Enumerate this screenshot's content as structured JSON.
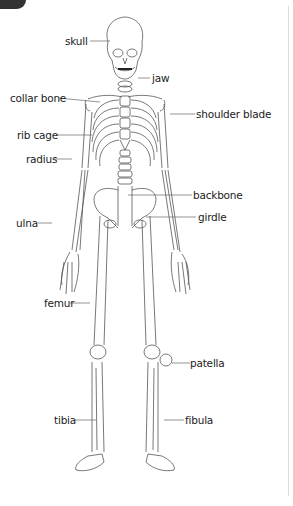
{
  "labels": {
    "skull": "skull",
    "jaw": "jaw",
    "collar_bone": "collar bone",
    "shoulder_blade": "shoulder blade",
    "rib_cage": "rib cage",
    "radius": "radius",
    "backbone": "backbone",
    "girdle": "girdle",
    "ulna": "ulna",
    "femur": "femur",
    "patella": "patella",
    "tibia": "tibia",
    "fibula": "fibula"
  },
  "colors": {
    "line": "#555555",
    "text": "#222222",
    "tab": "#333333",
    "frame": "#dddddd"
  }
}
